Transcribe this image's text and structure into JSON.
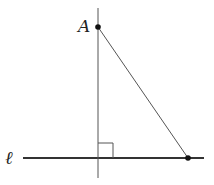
{
  "diagram": {
    "title": "",
    "labels": {
      "point_a": "A",
      "line_l": "ℓ"
    },
    "points": {
      "A": {
        "x": 98,
        "y": 27
      },
      "B": {
        "x": 188,
        "y": 158
      },
      "foot": {
        "x": 98,
        "y": 158
      }
    },
    "line_l": {
      "x1": 23,
      "x2": 204,
      "y": 158
    },
    "perpendicular": {
      "x": 98,
      "y1": 8,
      "y2": 178
    },
    "right_angle_marker": {
      "x": 98,
      "y": 143,
      "size": 15
    },
    "colors": {
      "stroke": "#555555",
      "line_l": "#333333",
      "point": "#111111"
    }
  }
}
